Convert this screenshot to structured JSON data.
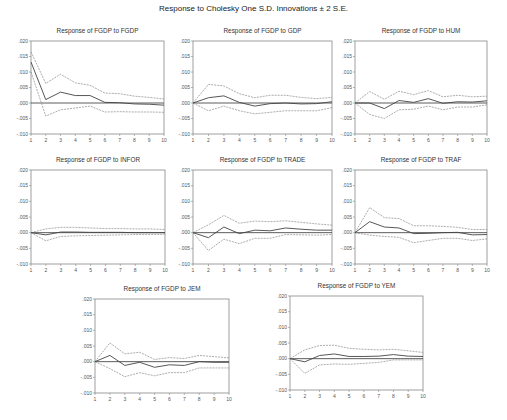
{
  "chart_data": {
    "type": "line",
    "title": "Response to Cholesky One S.D. Innovations ± 2 S.E.",
    "x": [
      1,
      2,
      3,
      4,
      5,
      6,
      7,
      8,
      9,
      10
    ],
    "ylim": [
      -0.01,
      0.02
    ],
    "yticks": [
      ".020",
      ".015",
      ".010",
      ".005",
      ".000",
      "-.005",
      "-.010"
    ],
    "ytick_values": [
      0.02,
      0.015,
      0.01,
      0.005,
      0.0,
      -0.005,
      -0.01
    ],
    "xticks": [
      "1",
      "2",
      "3",
      "4",
      "5",
      "6",
      "7",
      "8",
      "9",
      "10"
    ],
    "grid": false,
    "panels": [
      {
        "title": "Response of FGDP to FGDP",
        "response": [
          0.0132,
          0.0011,
          0.0035,
          0.0024,
          0.0024,
          0.0002,
          0.0001,
          -0.0003,
          -0.0004,
          -0.0007
        ],
        "upper": [
          0.0165,
          0.0063,
          0.0093,
          0.0065,
          0.0057,
          0.0032,
          0.003,
          0.0022,
          0.0018,
          0.0013
        ],
        "lower": [
          0.01,
          -0.0042,
          -0.0022,
          -0.0016,
          -0.001,
          -0.0029,
          -0.0028,
          -0.0029,
          -0.0029,
          -0.003
        ]
      },
      {
        "title": "Response of FGDP to GDP",
        "response": [
          0.0,
          0.0017,
          0.0023,
          0.0002,
          -0.001,
          -0.0002,
          0.0,
          -0.0003,
          -0.0002,
          0.0004
        ],
        "upper": [
          0.0,
          0.006,
          0.0055,
          0.003,
          0.0017,
          0.0025,
          0.0025,
          0.0018,
          0.0014,
          0.0018
        ],
        "lower": [
          0.0,
          -0.0025,
          -0.001,
          -0.0025,
          -0.0035,
          -0.003,
          -0.0025,
          -0.0025,
          -0.0025,
          -0.0015
        ]
      },
      {
        "title": "Response of FGDP to HUM",
        "response": [
          0.0,
          0.0,
          -0.0018,
          0.0008,
          0.0002,
          0.0014,
          -0.0001,
          0.0004,
          0.0003,
          0.0007
        ],
        "upper": [
          0.0,
          0.0037,
          0.0012,
          0.0038,
          0.0027,
          0.004,
          0.002,
          0.0025,
          0.002,
          0.0022
        ],
        "lower": [
          0.0,
          -0.0037,
          -0.005,
          -0.0022,
          -0.002,
          -0.001,
          -0.0022,
          -0.0013,
          -0.0013,
          -0.0006
        ]
      },
      {
        "title": "Response of FGDP to INFOR",
        "response": [
          0.0,
          -0.0007,
          0.0002,
          0.0002,
          0.0001,
          0.0001,
          0.0001,
          0.0,
          0.0,
          0.0
        ],
        "upper": [
          0.0,
          0.0012,
          0.0017,
          0.0017,
          0.0015,
          0.0013,
          0.0013,
          0.0012,
          0.0012,
          0.001
        ],
        "lower": [
          0.0,
          -0.0026,
          -0.0012,
          -0.001,
          -0.0009,
          -0.0008,
          -0.0007,
          -0.0006,
          -0.0006,
          -0.0005
        ]
      },
      {
        "title": "Response of FGDP to TRADE",
        "response": [
          0.0,
          -0.0016,
          0.0018,
          -0.0003,
          0.0008,
          0.0006,
          0.0015,
          0.0011,
          0.0008,
          0.0008
        ],
        "upper": [
          0.0,
          0.0025,
          0.0055,
          0.003,
          0.0037,
          0.0035,
          0.0038,
          0.0033,
          0.0028,
          0.0024
        ],
        "lower": [
          0.0,
          -0.0057,
          -0.0021,
          -0.0035,
          -0.0018,
          -0.0018,
          -0.0006,
          -0.0007,
          -0.0008,
          -0.0006
        ]
      },
      {
        "title": "Response of FGDP to TRAF",
        "response": [
          0.0,
          0.0035,
          0.0018,
          0.0015,
          -0.0003,
          -0.0002,
          0.0,
          0.0001,
          -0.0007,
          -0.0006
        ],
        "upper": [
          0.0,
          0.008,
          0.0048,
          0.0045,
          0.0022,
          0.0022,
          0.002,
          0.0017,
          0.001,
          0.001
        ],
        "lower": [
          0.0,
          -0.0008,
          -0.0012,
          -0.0015,
          -0.0032,
          -0.0025,
          -0.0018,
          -0.0018,
          -0.0025,
          -0.002
        ]
      },
      {
        "title": "Response of FGDP to JEM",
        "response": [
          0.0,
          0.002,
          -0.0012,
          -0.0002,
          -0.0018,
          -0.001,
          -0.0012,
          0.0,
          -0.0002,
          -0.0002
        ],
        "upper": [
          0.0,
          0.006,
          0.0025,
          0.003,
          0.0007,
          0.0013,
          0.001,
          0.002,
          0.0016,
          0.0012
        ],
        "lower": [
          0.0,
          -0.0022,
          -0.0048,
          -0.0035,
          -0.0045,
          -0.0035,
          -0.0035,
          -0.002,
          -0.002,
          -0.002
        ]
      },
      {
        "title": "Response of FGDP to YEM",
        "response": [
          0.0,
          -0.001,
          0.001,
          0.0015,
          0.0007,
          0.0007,
          0.0008,
          0.0013,
          0.0008,
          0.0007
        ],
        "upper": [
          0.0,
          0.0028,
          0.0042,
          0.0043,
          0.0033,
          0.003,
          0.0028,
          0.003,
          0.0025,
          0.002
        ],
        "lower": [
          0.0,
          -0.0047,
          -0.002,
          -0.0017,
          -0.0018,
          -0.0015,
          -0.0012,
          -0.0004,
          -0.0004,
          -0.0004
        ]
      }
    ]
  }
}
